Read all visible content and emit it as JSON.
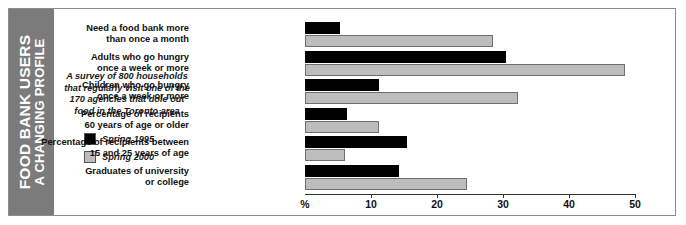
{
  "sidebar": {
    "title_main": "FOOD BANK USERS",
    "title_sub": "A CHANGING PROFILE",
    "background_color": "#7b7b7b",
    "text_color": "#ffffff"
  },
  "blurb": {
    "text": "A survey of 800 households that regularly visit one of the 170 agencies that dole out food in the Toronto area"
  },
  "legend": {
    "items": [
      {
        "label": "Spring 1995",
        "color": "#000000"
      },
      {
        "label": "Spring 2000",
        "color": "#bdbdbd"
      }
    ]
  },
  "chart_data": {
    "type": "bar",
    "orientation": "horizontal",
    "subtitle": "A survey of 800 households that regularly visit one of the 170 agencies that dole out food in the Toronto area",
    "categories": [
      "Need a food bank more\nthan once a month",
      "Adults who go hungry\nonce a week or more",
      "Children who go hungry\nonce a week or more",
      "Percentage of recipients\n60 years of age or older",
      "Percentage of recipients between\n15 and 25 years of age",
      "Graduates of university\nor college"
    ],
    "series": [
      {
        "name": "Spring 1995",
        "color": "#000000",
        "values": [
          5.3,
          30.5,
          11.2,
          6.3,
          15.4,
          14.2
        ]
      },
      {
        "name": "Spring 2000",
        "color": "#bdbdbd",
        "values": [
          28.5,
          48.5,
          32.3,
          11.2,
          6.1,
          24.5
        ]
      }
    ],
    "xlabel": "%",
    "ylabel": "",
    "xlim": [
      0,
      50
    ],
    "xticks": [
      0,
      10,
      20,
      30,
      40,
      50
    ],
    "xtick_labels": [
      "%",
      "10",
      "20",
      "30",
      "40",
      "50"
    ],
    "grid": false,
    "legend_position": "left"
  }
}
